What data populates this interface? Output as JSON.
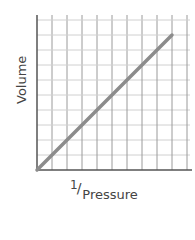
{
  "chart_data": {
    "type": "line",
    "title": "",
    "xlabel": "1/Pressure",
    "xlabel_parts": {
      "numerator": "1",
      "slash": "/",
      "denominator": "Pressure"
    },
    "ylabel": "Volume",
    "x": [
      0,
      1,
      2,
      3,
      4,
      5,
      6,
      7,
      8,
      9
    ],
    "series": [
      {
        "name": "Volume vs 1/Pressure",
        "values": [
          0,
          1,
          2,
          3,
          4,
          5,
          6,
          7,
          8,
          9
        ],
        "color": "#8c8c8c"
      }
    ],
    "xlim": [
      0,
      10.3
    ],
    "ylim": [
      0,
      10.3
    ],
    "grid": true,
    "tick_labels": false,
    "legend": "none"
  },
  "colors": {
    "axis": "#555555",
    "grid_major": "#9a9a9a",
    "grid_minor": "#d0d0d0",
    "line": "#8c8c8c",
    "text": "#444444"
  }
}
